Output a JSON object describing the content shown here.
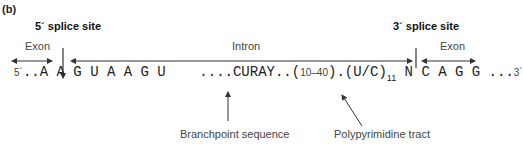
{
  "panel_label": "(b)",
  "splice_sites": {
    "five_prime": "5´ splice site",
    "three_prime": "3´ splice site"
  },
  "regions": {
    "exon_left": "Exon",
    "intron": "Intron",
    "exon_right": "Exon"
  },
  "sequence": {
    "five_end": "5´",
    "exon_left": "..A A",
    "intron_start": "G U A A G U",
    "branch": "....CURAY..",
    "spacer_open": "(",
    "spacer": "10–40",
    "spacer_close": ").",
    "poly_open": "(U/C)",
    "poly_count": "11",
    "acceptor": "N C A G",
    "exon_right": "G ...",
    "three_end": "3´"
  },
  "annotations": {
    "branchpoint": "Branchpoint sequence",
    "polypyrimidine": "Polypyrimidine tract"
  },
  "colors": {
    "text": "#222222",
    "label": "#444444",
    "arrow": "#333333"
  }
}
